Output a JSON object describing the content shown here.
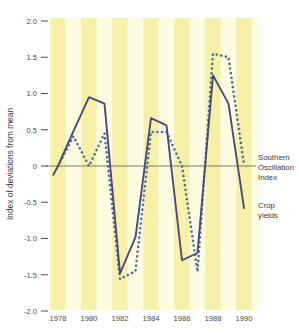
{
  "chart_data": {
    "type": "line",
    "title": "",
    "xlabel": "",
    "ylabel": "Index of deviations from mean",
    "xlim": [
      1977.6,
      1990.8
    ],
    "ylim": [
      -2.0,
      2.0
    ],
    "grid": false,
    "background_bands": "alternating pale yellow vertical year bands",
    "zero_reference_line": true,
    "legend_position": "right-inline",
    "x_ticks": [
      1978,
      1980,
      1982,
      1984,
      1986,
      1988,
      1990
    ],
    "x_tick_labels": [
      "1978",
      "1980",
      "1982",
      "1984",
      "1986",
      "1988",
      "1990"
    ],
    "y_ticks": [
      2.0,
      1.5,
      1.0,
      0.5,
      0,
      -0.5,
      -1.0,
      -1.5,
      -2.0
    ],
    "y_tick_labels": [
      "2.0",
      "1.5",
      "1.0",
      "0.5",
      "0",
      "-0.5",
      "-1.0",
      "-1.5",
      "-2.0"
    ],
    "x": [
      1977.7,
      1978,
      1979,
      1980,
      1981,
      1982,
      1983,
      1984,
      1985,
      1986,
      1987,
      1988,
      1989,
      1990,
      1990.6
    ],
    "series": [
      {
        "name": "Crop yields",
        "style": "solid",
        "color": "#4a4a7a",
        "values": [
          -0.12,
          0.0,
          0.48,
          0.95,
          0.86,
          -1.48,
          -0.98,
          0.66,
          0.56,
          -1.3,
          -1.2,
          1.25,
          0.86,
          -0.58,
          null
        ]
      },
      {
        "name": "Southern Oscillation Index",
        "style": "dotted",
        "color": "#4a6fa0",
        "values": [
          null,
          0.0,
          0.41,
          0.0,
          0.45,
          -1.56,
          -1.45,
          0.47,
          0.47,
          0.0,
          -1.46,
          1.55,
          1.5,
          0.02,
          null
        ]
      }
    ],
    "annotations": [
      {
        "text": "Southern Oscillation Index",
        "series": "Southern Oscillation Index"
      },
      {
        "text": "Crop yields",
        "series": "Crop yields"
      }
    ]
  },
  "axes": {
    "y_axis_title": "Index of deviations from mean",
    "y_tick_labels": [
      "2.0",
      "1.5",
      "1.0",
      "0.5",
      "0",
      "-0.5",
      "-1.0",
      "-1.5",
      "-2.0"
    ],
    "x_tick_labels": [
      "1978",
      "1980",
      "1982",
      "1984",
      "1986",
      "1988",
      "1990"
    ]
  },
  "legend": {
    "soi_line1": "Southern",
    "soi_line2": "Oscillation",
    "soi_line3": "Index",
    "crop_line1": "Crop",
    "crop_line2": "yields"
  },
  "colors": {
    "solid_series": "#4a4a7a",
    "dotted_series": "#4a6fa0",
    "band_light": "#fdfbe0",
    "band_dark": "#f7f0a8",
    "zero_line": "#6b6b4e",
    "text": "#3c3c3c",
    "background": "#ffffff"
  }
}
